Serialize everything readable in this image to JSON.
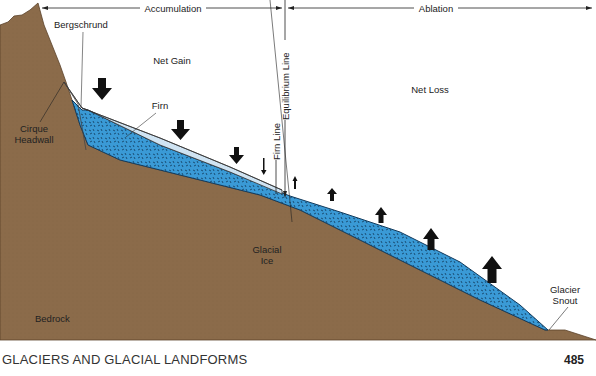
{
  "diagram": {
    "zones": {
      "accumulation": "Accumulation",
      "ablation": "Ablation"
    },
    "regions": {
      "net_gain": "Net Gain",
      "net_loss": "Net Loss"
    },
    "labels": {
      "bergschrund": "Bergschrund",
      "firn": "Firn",
      "cirque_line1": "Cirque",
      "cirque_line2": "Headwall",
      "firn_line": "Firn Line",
      "equilibrium_line": "Equilibrium Line",
      "glacial_line1": "Glacial",
      "glacial_line2": "Ice",
      "snout_line1": "Glacier",
      "snout_line2": "Snout",
      "bedrock": "Bedrock"
    },
    "colors": {
      "bedrock": "#8b6b4a",
      "glacial_ice": "#3a9ad6",
      "firn": "#cfe3f2",
      "arrows": "#111111"
    }
  },
  "footer": {
    "title": "GLACIERS AND GLACIAL LANDFORMS",
    "page_number": "485"
  }
}
